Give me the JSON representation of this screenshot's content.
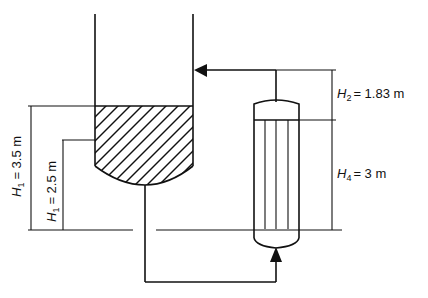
{
  "diagram": {
    "type": "process-schematic",
    "colors": {
      "line": "#111111",
      "background": "#ffffff"
    },
    "labels": {
      "h1_high": {
        "var": "H",
        "sub": "1",
        "eq": "= 3.5 m"
      },
      "h1_low": {
        "var": "H",
        "sub": "1",
        "eq": "= 2.5 m"
      },
      "h2": {
        "var": "H",
        "sub": "2",
        "eq": "= 1.83 m"
      },
      "h4": {
        "var": "H",
        "sub": "4",
        "eq": "= 3 m"
      }
    },
    "components": [
      {
        "name": "vessel",
        "fill": "hatched liquid"
      },
      {
        "name": "heat-exchanger",
        "tubes": 4
      },
      {
        "name": "outlet-pipe"
      },
      {
        "name": "return-pipe",
        "arrow": "left into vessel"
      },
      {
        "name": "inlet-arrow",
        "arrow": "up into exchanger"
      }
    ]
  }
}
